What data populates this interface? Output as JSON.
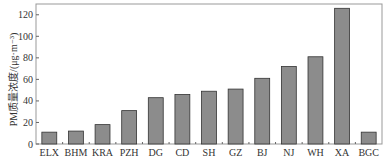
{
  "chart_data": {
    "type": "bar",
    "title": "",
    "xlabel": "",
    "ylabel": "PM质量浓度/(μg·m⁻³)",
    "ylim": [
      0,
      130
    ],
    "yticks": [
      0,
      20,
      40,
      60,
      80,
      100,
      120
    ],
    "grid": false,
    "legend": null,
    "categories": [
      "ELX",
      "BHM",
      "KRA",
      "PZH",
      "DG",
      "CD",
      "SH",
      "GZ",
      "BJ",
      "NJ",
      "WH",
      "XA",
      "BGC"
    ],
    "values": [
      11,
      12,
      18,
      31,
      43,
      46,
      49,
      51,
      61,
      72,
      81,
      126,
      11
    ],
    "bar_color": "#8c8c8c",
    "bar_edge_color": "#333333"
  }
}
